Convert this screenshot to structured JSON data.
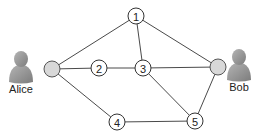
{
  "diagram": {
    "type": "network-graph",
    "people": [
      {
        "id": "alice",
        "name": "Alice",
        "icon": "person-icon",
        "x": 21,
        "y": 68,
        "label_y": 93,
        "endpoint": {
          "x": 52,
          "y": 69
        }
      },
      {
        "id": "bob",
        "name": "Bob",
        "icon": "person-icon",
        "x": 239,
        "y": 66,
        "label_y": 91,
        "endpoint": {
          "x": 218,
          "y": 67
        }
      }
    ],
    "nodes": [
      {
        "id": "1",
        "label": "1",
        "x": 136,
        "y": 16
      },
      {
        "id": "2",
        "label": "2",
        "x": 99,
        "y": 68
      },
      {
        "id": "3",
        "label": "3",
        "x": 143,
        "y": 68
      },
      {
        "id": "4",
        "label": "4",
        "x": 117,
        "y": 122
      },
      {
        "id": "5",
        "label": "5",
        "x": 195,
        "y": 121
      }
    ],
    "edges": [
      [
        "alice",
        "1"
      ],
      [
        "alice",
        "2"
      ],
      [
        "alice",
        "4"
      ],
      [
        "2",
        "3"
      ],
      [
        "1",
        "3"
      ],
      [
        "1",
        "bob"
      ],
      [
        "3",
        "bob"
      ],
      [
        "3",
        "5"
      ],
      [
        "4",
        "5"
      ],
      [
        "5",
        "bob"
      ]
    ],
    "colors": {
      "endpoint_fill": "#d8d8d8",
      "person_fill": "#9a9a9a",
      "edge": "#4a4a4a"
    }
  }
}
